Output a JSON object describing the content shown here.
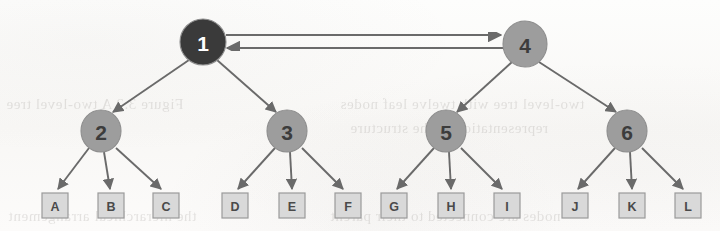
{
  "diagram": {
    "type": "tree-diagram",
    "canvas": {
      "width": 720,
      "height": 231
    },
    "colors": {
      "root_dark_fill": "#3a3a3a",
      "root_dark_text": "#ffffff",
      "node_gray_fill": "#9d9d9d",
      "node_gray_text": "#3c3c3c",
      "leaf_fill": "#d9d9d9",
      "leaf_text": "#4a4a4a",
      "edge_stroke": "#6a6a6a",
      "outline_stroke": "#8e8e8e",
      "background": "#fbfbfa"
    },
    "nodes": [
      {
        "id": "n1",
        "label": "1",
        "shape": "circle",
        "style": "dark",
        "cx": 203,
        "cy": 42,
        "rx": 23,
        "ry": 23
      },
      {
        "id": "n4",
        "label": "4",
        "shape": "circle",
        "style": "gray",
        "cx": 525,
        "cy": 44,
        "rx": 22,
        "ry": 23
      },
      {
        "id": "n2",
        "label": "2",
        "shape": "circle",
        "style": "gray",
        "cx": 101,
        "cy": 131,
        "rx": 20,
        "ry": 21
      },
      {
        "id": "n3",
        "label": "3",
        "shape": "circle",
        "style": "gray",
        "cx": 287,
        "cy": 131,
        "rx": 20,
        "ry": 21
      },
      {
        "id": "n5",
        "label": "5",
        "shape": "circle",
        "style": "gray",
        "cx": 446,
        "cy": 131,
        "rx": 20,
        "ry": 21
      },
      {
        "id": "n6",
        "label": "6",
        "shape": "circle",
        "style": "gray",
        "cx": 627,
        "cy": 131,
        "rx": 20,
        "ry": 21
      }
    ],
    "leaves": [
      {
        "id": "lA",
        "label": "A",
        "x": 42,
        "y": 193,
        "w": 26,
        "h": 25
      },
      {
        "id": "lB",
        "label": "B",
        "x": 98,
        "y": 193,
        "w": 26,
        "h": 25
      },
      {
        "id": "lC",
        "label": "C",
        "x": 153,
        "y": 193,
        "w": 26,
        "h": 25
      },
      {
        "id": "lD",
        "label": "D",
        "x": 222,
        "y": 193,
        "w": 26,
        "h": 25
      },
      {
        "id": "lE",
        "label": "E",
        "x": 279,
        "y": 193,
        "w": 26,
        "h": 25
      },
      {
        "id": "lF",
        "label": "F",
        "x": 335,
        "y": 193,
        "w": 26,
        "h": 25
      },
      {
        "id": "lG",
        "label": "G",
        "x": 381,
        "y": 193,
        "w": 26,
        "h": 25
      },
      {
        "id": "lH",
        "label": "H",
        "x": 438,
        "y": 193,
        "w": 26,
        "h": 25
      },
      {
        "id": "lI",
        "label": "I",
        "x": 494,
        "y": 193,
        "w": 26,
        "h": 25
      },
      {
        "id": "lJ",
        "label": "J",
        "x": 562,
        "y": 193,
        "w": 26,
        "h": 25
      },
      {
        "id": "lK",
        "label": "K",
        "x": 619,
        "y": 193,
        "w": 26,
        "h": 25
      },
      {
        "id": "lL",
        "label": "L",
        "x": 675,
        "y": 193,
        "w": 26,
        "h": 25
      }
    ],
    "edges": [
      {
        "from": "n1",
        "to": "n2",
        "x1": 189,
        "y1": 60,
        "x2": 113,
        "y2": 112
      },
      {
        "from": "n1",
        "to": "n3",
        "x1": 217,
        "y1": 60,
        "x2": 276,
        "y2": 112
      },
      {
        "from": "n4",
        "to": "n5",
        "x1": 512,
        "y1": 62,
        "x2": 457,
        "y2": 112
      },
      {
        "from": "n4",
        "to": "n6",
        "x1": 539,
        "y1": 62,
        "x2": 616,
        "y2": 112
      },
      {
        "from": "n2",
        "to": "lA",
        "x1": 89,
        "y1": 148,
        "x2": 58,
        "y2": 189
      },
      {
        "from": "n2",
        "to": "lB",
        "x1": 104,
        "y1": 152,
        "x2": 110,
        "y2": 189
      },
      {
        "from": "n2",
        "to": "lC",
        "x1": 116,
        "y1": 148,
        "x2": 161,
        "y2": 189
      },
      {
        "from": "n3",
        "to": "lD",
        "x1": 275,
        "y1": 148,
        "x2": 238,
        "y2": 189
      },
      {
        "from": "n3",
        "to": "lE",
        "x1": 290,
        "y1": 152,
        "x2": 292,
        "y2": 189
      },
      {
        "from": "n3",
        "to": "lF",
        "x1": 302,
        "y1": 148,
        "x2": 343,
        "y2": 189
      },
      {
        "from": "n5",
        "to": "lG",
        "x1": 434,
        "y1": 148,
        "x2": 397,
        "y2": 189
      },
      {
        "from": "n5",
        "to": "lH",
        "x1": 449,
        "y1": 152,
        "x2": 451,
        "y2": 189
      },
      {
        "from": "n5",
        "to": "lI",
        "x1": 461,
        "y1": 148,
        "x2": 502,
        "y2": 189
      },
      {
        "from": "n6",
        "to": "lJ",
        "x1": 615,
        "y1": 148,
        "x2": 578,
        "y2": 189
      },
      {
        "from": "n6",
        "to": "lK",
        "x1": 630,
        "y1": 152,
        "x2": 632,
        "y2": 189
      },
      {
        "from": "n6",
        "to": "lL",
        "x1": 642,
        "y1": 148,
        "x2": 683,
        "y2": 189
      }
    ],
    "cross_links": [
      {
        "id": "link-1-to-4",
        "from": "n1",
        "to": "n4",
        "direction": "right",
        "x1": 226,
        "y1": 35,
        "x2": 501,
        "y2": 35
      },
      {
        "id": "link-4-to-1",
        "from": "n4",
        "to": "n1",
        "direction": "left",
        "x1": 503,
        "y1": 48,
        "x2": 227,
        "y2": 48
      }
    ],
    "ghost_text": {
      "line1": "Figure 3.2 A two-level tree",
      "line2": "two-level tree with twelve leaf nodes",
      "line3": "representation of the structure",
      "line4": "the hierarchical arrangement",
      "line5": "nodes are connected to their parent"
    }
  }
}
